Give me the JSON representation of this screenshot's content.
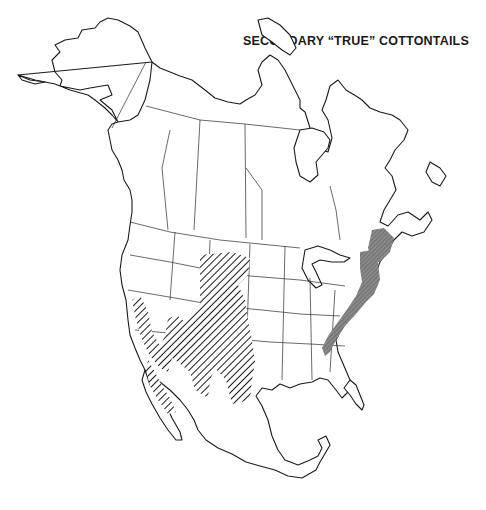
{
  "map": {
    "title": "SECONDARY “TRUE” COTTONTAILS",
    "region": "North America",
    "legend_patterns": [
      {
        "name": "diagonal-hatch",
        "color": "#1a1a1a",
        "areas": "Western U.S. and northern Mexico"
      },
      {
        "name": "dark-stipple",
        "color": "#6e6e6e",
        "areas": "Appalachian and New England"
      }
    ],
    "colors": {
      "land": "#ffffff",
      "outline": "#1a1a1a",
      "shade": "#6e6e6e"
    }
  }
}
